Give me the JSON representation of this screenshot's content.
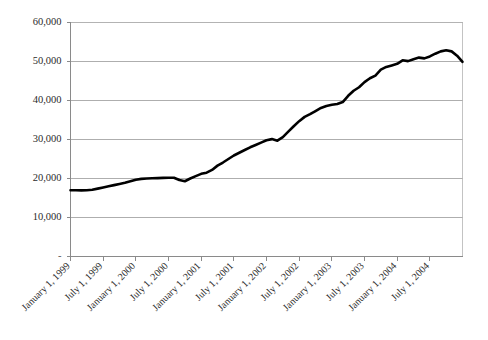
{
  "chart_data": {
    "type": "line",
    "title": "",
    "subtitle": "",
    "xlabel": "",
    "ylabel": "",
    "ylim": [
      0,
      60000
    ],
    "y_ticks": [
      "-",
      "10,000",
      "20,000",
      "30,000",
      "40,000",
      "50,000",
      "60,000"
    ],
    "y_tick_values": [
      0,
      10000,
      20000,
      30000,
      40000,
      50000,
      60000
    ],
    "grid": "horizontal",
    "legend": "none",
    "x_tick_labels": [
      "January 1, 1999",
      "July 1, 1999",
      "January 1, 2000",
      "July 1, 2000",
      "January 1, 2001",
      "July 1, 2001",
      "January 1, 2002",
      "July 1, 2002",
      "January 1, 2003",
      "July 1, 2003",
      "January 1, 2004",
      "July 1, 2004"
    ],
    "x_tick_rotation_degrees": 45,
    "series": [
      {
        "name": "Series 1",
        "color": "#000000",
        "x": [
          "1999-01",
          "1999-02",
          "1999-03",
          "1999-04",
          "1999-05",
          "1999-06",
          "1999-07",
          "1999-08",
          "1999-09",
          "1999-10",
          "1999-11",
          "1999-12",
          "2000-01",
          "2000-02",
          "2000-03",
          "2000-04",
          "2000-05",
          "2000-06",
          "2000-07",
          "2000-08",
          "2000-09",
          "2000-10",
          "2000-11",
          "2000-12",
          "2001-01",
          "2001-02",
          "2001-03",
          "2001-04",
          "2001-05",
          "2001-06",
          "2001-07",
          "2001-08",
          "2001-09",
          "2001-10",
          "2001-11",
          "2001-12",
          "2002-01",
          "2002-02",
          "2002-03",
          "2002-04",
          "2002-05",
          "2002-06",
          "2002-07",
          "2002-08",
          "2002-09",
          "2002-10",
          "2002-11",
          "2002-12",
          "2003-01",
          "2003-02",
          "2003-03",
          "2003-04",
          "2003-05",
          "2003-06",
          "2003-07",
          "2003-08",
          "2003-09",
          "2003-10",
          "2003-11",
          "2003-12",
          "2004-01",
          "2004-02",
          "2004-03",
          "2004-04",
          "2004-05",
          "2004-06",
          "2004-07",
          "2004-08",
          "2004-09",
          "2004-10",
          "2004-11",
          "2004-12",
          "2005-01"
        ],
        "values": [
          17000,
          17000,
          16950,
          17000,
          17100,
          17400,
          17700,
          18000,
          18300,
          18600,
          18900,
          19300,
          19700,
          19900,
          20000,
          20050,
          20100,
          20150,
          20200,
          20200,
          19600,
          19300,
          20000,
          20600,
          21200,
          21500,
          22200,
          23300,
          24100,
          25000,
          25900,
          26600,
          27300,
          28000,
          28600,
          29200,
          29800,
          30100,
          29700,
          30600,
          32000,
          33400,
          34700,
          35800,
          36500,
          37300,
          38100,
          38600,
          38900,
          39100,
          39600,
          41200,
          42500,
          43400,
          44700,
          45700,
          46400,
          47900,
          48600,
          49000,
          49400,
          50300,
          50100,
          50600,
          51000,
          50800,
          51300,
          52000,
          52600,
          52900,
          52600,
          51500,
          49900
        ]
      }
    ]
  }
}
